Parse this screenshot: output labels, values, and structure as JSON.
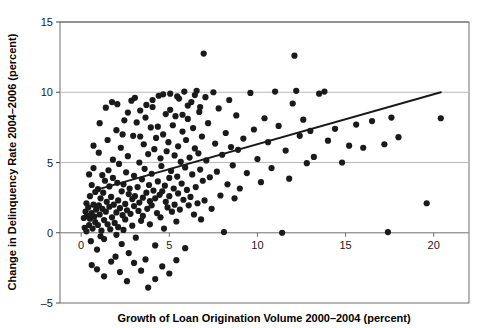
{
  "chart_data": {
    "type": "scatter",
    "title": "",
    "xlabel": "Growth of Loan Origination Volume 2000–2004 (percent)",
    "ylabel": "Change in Delinquency Rate 2004–2006 (percent)",
    "xlim": [
      -1.2,
      22.0
    ],
    "ylim": [
      -5,
      15
    ],
    "xticks": [
      0,
      5,
      10,
      15,
      20
    ],
    "xticklabels": [
      "0",
      "5",
      "10",
      "15",
      "20"
    ],
    "yticks": [
      -5,
      0,
      5,
      10,
      15
    ],
    "yticklabels": [
      "-5",
      "0",
      "5",
      "10",
      "15"
    ],
    "grid": "horizontal",
    "legend": "none",
    "marker_color": "#1a1a1a",
    "marker_size": 3.1,
    "trendline": {
      "label": "linear fit",
      "color": "#1a1a1a",
      "width": 2.0,
      "x_start": 0.85,
      "y_start": 3.05,
      "x_end": 20.4,
      "y_end": 10.0
    },
    "points": [
      [
        0.15,
        1.05
      ],
      [
        0.2,
        0.35
      ],
      [
        0.25,
        1.5
      ],
      [
        0.3,
        2.1
      ],
      [
        0.3,
        0.1
      ],
      [
        0.35,
        1.2
      ],
      [
        0.4,
        1.8
      ],
      [
        0.45,
        0.55
      ],
      [
        0.5,
        2.6
      ],
      [
        0.5,
        1.0
      ],
      [
        0.55,
        -0.6
      ],
      [
        0.6,
        3.4
      ],
      [
        0.6,
        1.4
      ],
      [
        0.65,
        0.3
      ],
      [
        0.7,
        2.0
      ],
      [
        0.7,
        4.6
      ],
      [
        0.75,
        1.15
      ],
      [
        0.8,
        0.75
      ],
      [
        0.8,
        2.9
      ],
      [
        0.85,
        1.65
      ],
      [
        0.9,
        -1.2
      ],
      [
        0.95,
        3.1
      ],
      [
        0.95,
        0.55
      ],
      [
        1.0,
        1.95
      ],
      [
        1.0,
        5.7
      ],
      [
        1.05,
        1.3
      ],
      [
        1.1,
        2.45
      ],
      [
        1.15,
        0.15
      ],
      [
        1.2,
        4.1
      ],
      [
        1.2,
        1.7
      ],
      [
        1.25,
        2.85
      ],
      [
        1.3,
        0.9
      ],
      [
        1.3,
        -0.45
      ],
      [
        1.35,
        3.7
      ],
      [
        1.4,
        1.5
      ],
      [
        1.45,
        2.2
      ],
      [
        1.5,
        6.6
      ],
      [
        1.5,
        0.6
      ],
      [
        1.55,
        4.45
      ],
      [
        1.6,
        1.85
      ],
      [
        1.6,
        3.3
      ],
      [
        1.65,
        0.25
      ],
      [
        1.7,
        2.55
      ],
      [
        1.75,
        1.1
      ],
      [
        1.8,
        5.2
      ],
      [
        1.8,
        3.9
      ],
      [
        1.85,
        2.0
      ],
      [
        1.9,
        0.7
      ],
      [
        1.95,
        -1.7
      ],
      [
        2.0,
        7.3
      ],
      [
        2.0,
        1.45
      ],
      [
        2.05,
        3.55
      ],
      [
        2.1,
        2.3
      ],
      [
        2.1,
        0.4
      ],
      [
        2.15,
        4.9
      ],
      [
        2.2,
        1.75
      ],
      [
        2.25,
        6.05
      ],
      [
        2.3,
        2.95
      ],
      [
        2.3,
        -0.8
      ],
      [
        2.35,
        1.25
      ],
      [
        2.4,
        3.45
      ],
      [
        2.45,
        8.0
      ],
      [
        2.5,
        2.05
      ],
      [
        2.5,
        0.95
      ],
      [
        2.55,
        4.3
      ],
      [
        2.6,
        1.6
      ],
      [
        2.65,
        5.45
      ],
      [
        2.7,
        2.75
      ],
      [
        2.7,
        -1.45
      ],
      [
        2.75,
        3.15
      ],
      [
        2.8,
        1.35
      ],
      [
        2.85,
        9.4
      ],
      [
        2.9,
        2.4
      ],
      [
        2.9,
        0.5
      ],
      [
        2.95,
        6.9
      ],
      [
        3.0,
        4.05
      ],
      [
        3.0,
        1.9
      ],
      [
        3.05,
        2.6
      ],
      [
        3.1,
        -0.35
      ],
      [
        3.15,
        7.85
      ],
      [
        3.2,
        3.25
      ],
      [
        3.25,
        1.55
      ],
      [
        3.3,
        5.0
      ],
      [
        3.3,
        2.15
      ],
      [
        3.35,
        8.7
      ],
      [
        3.4,
        0.85
      ],
      [
        3.45,
        3.8
      ],
      [
        3.5,
        2.5
      ],
      [
        3.5,
        1.2
      ],
      [
        3.55,
        6.3
      ],
      [
        3.6,
        4.55
      ],
      [
        3.65,
        -1.9
      ],
      [
        3.7,
        2.85
      ],
      [
        3.7,
        9.1
      ],
      [
        3.75,
        1.7
      ],
      [
        3.8,
        5.6
      ],
      [
        3.85,
        3.4
      ],
      [
        3.9,
        2.25
      ],
      [
        3.9,
        0.6
      ],
      [
        3.95,
        7.5
      ],
      [
        4.0,
        4.2
      ],
      [
        4.0,
        1.95
      ],
      [
        4.05,
        8.95
      ],
      [
        4.1,
        3.0
      ],
      [
        4.15,
        5.95
      ],
      [
        4.2,
        2.45
      ],
      [
        4.2,
        -0.9
      ],
      [
        4.25,
        6.75
      ],
      [
        4.3,
        1.4
      ],
      [
        4.35,
        3.65
      ],
      [
        4.4,
        9.75
      ],
      [
        4.45,
        2.7
      ],
      [
        4.5,
        5.3
      ],
      [
        4.5,
        1.1
      ],
      [
        4.55,
        4.75
      ],
      [
        4.6,
        2.95
      ],
      [
        4.65,
        7.0
      ],
      [
        4.7,
        0.3
      ],
      [
        4.75,
        3.35
      ],
      [
        4.8,
        8.45
      ],
      [
        4.8,
        2.2
      ],
      [
        4.85,
        5.8
      ],
      [
        4.9,
        1.8
      ],
      [
        4.95,
        6.45
      ],
      [
        5.0,
        3.9
      ],
      [
        5.0,
        2.6
      ],
      [
        5.05,
        9.9
      ],
      [
        5.1,
        4.4
      ],
      [
        5.15,
        1.5
      ],
      [
        5.2,
        7.65
      ],
      [
        5.25,
        3.15
      ],
      [
        5.3,
        5.5
      ],
      [
        5.3,
        2.0
      ],
      [
        5.35,
        8.3
      ],
      [
        5.4,
        0.8
      ],
      [
        5.45,
        4.0
      ],
      [
        5.5,
        6.15
      ],
      [
        5.5,
        2.8
      ],
      [
        5.55,
        9.55
      ],
      [
        5.6,
        1.65
      ],
      [
        5.65,
        5.05
      ],
      [
        5.7,
        3.5
      ],
      [
        5.75,
        7.2
      ],
      [
        5.8,
        2.35
      ],
      [
        5.85,
        10.05
      ],
      [
        5.9,
        4.65
      ],
      [
        5.9,
        -1.1
      ],
      [
        5.95,
        6.6
      ],
      [
        6.0,
        3.05
      ],
      [
        6.05,
        8.1
      ],
      [
        6.1,
        1.95
      ],
      [
        6.15,
        5.35
      ],
      [
        6.2,
        2.55
      ],
      [
        6.25,
        9.3
      ],
      [
        6.3,
        4.15
      ],
      [
        6.35,
        7.45
      ],
      [
        6.4,
        1.3
      ],
      [
        6.45,
        6.0
      ],
      [
        6.5,
        3.25
      ],
      [
        6.55,
        10.1
      ],
      [
        6.6,
        2.1
      ],
      [
        6.65,
        5.65
      ],
      [
        6.7,
        8.6
      ],
      [
        6.75,
        4.5
      ],
      [
        6.8,
        0.95
      ],
      [
        6.85,
        6.85
      ],
      [
        6.9,
        3.7
      ],
      [
        6.95,
        12.75
      ],
      [
        7.0,
        2.3
      ],
      [
        7.05,
        9.65
      ],
      [
        7.1,
        5.15
      ],
      [
        7.2,
        7.8
      ],
      [
        7.3,
        3.95
      ],
      [
        7.4,
        1.7
      ],
      [
        7.5,
        10.0
      ],
      [
        7.6,
        6.35
      ],
      [
        7.7,
        4.35
      ],
      [
        7.8,
        8.85
      ],
      [
        7.9,
        2.65
      ],
      [
        8.0,
        5.55
      ],
      [
        8.1,
        0.05
      ],
      [
        8.2,
        7.1
      ],
      [
        8.3,
        3.45
      ],
      [
        8.4,
        9.45
      ],
      [
        8.5,
        6.1
      ],
      [
        8.6,
        4.8
      ],
      [
        8.7,
        2.45
      ],
      [
        8.8,
        8.35
      ],
      [
        8.9,
        5.9
      ],
      [
        9.0,
        3.15
      ],
      [
        9.2,
        6.7
      ],
      [
        9.4,
        4.25
      ],
      [
        9.6,
        9.95
      ],
      [
        9.8,
        7.35
      ],
      [
        10.0,
        5.25
      ],
      [
        10.2,
        3.6
      ],
      [
        10.4,
        8.15
      ],
      [
        10.6,
        6.45
      ],
      [
        10.8,
        4.6
      ],
      [
        11.0,
        10.05
      ],
      [
        11.2,
        7.6
      ],
      [
        11.4,
        0.0
      ],
      [
        11.6,
        5.85
      ],
      [
        11.8,
        3.85
      ],
      [
        12.0,
        9.2
      ],
      [
        12.1,
        12.6
      ],
      [
        12.2,
        10.1
      ],
      [
        12.4,
        6.9
      ],
      [
        12.6,
        8.05
      ],
      [
        12.8,
        4.95
      ],
      [
        13.0,
        7.25
      ],
      [
        13.2,
        5.4
      ],
      [
        13.5,
        9.9
      ],
      [
        13.8,
        10.05
      ],
      [
        14.0,
        6.55
      ],
      [
        14.4,
        7.4
      ],
      [
        14.8,
        5.0
      ],
      [
        15.2,
        6.2
      ],
      [
        15.6,
        7.7
      ],
      [
        16.0,
        6.05
      ],
      [
        16.5,
        7.95
      ],
      [
        17.2,
        6.3
      ],
      [
        17.4,
        0.05
      ],
      [
        17.6,
        8.2
      ],
      [
        18.0,
        6.8
      ],
      [
        19.6,
        2.1
      ],
      [
        20.4,
        8.15
      ],
      [
        0.6,
        -2.3
      ],
      [
        0.9,
        -2.6
      ],
      [
        1.3,
        -3.1
      ],
      [
        1.7,
        -2.05
      ],
      [
        2.2,
        -2.8
      ],
      [
        2.6,
        -3.45
      ],
      [
        3.0,
        -2.15
      ],
      [
        3.4,
        -2.7
      ],
      [
        3.8,
        -3.9
      ],
      [
        4.2,
        -3.3
      ],
      [
        4.6,
        -2.4
      ],
      [
        5.0,
        -2.9
      ],
      [
        5.4,
        -1.95
      ],
      [
        2.0,
        -0.15
      ],
      [
        2.4,
        0.2
      ],
      [
        1.1,
        -0.25
      ],
      [
        0.45,
        4.15
      ],
      [
        0.7,
        6.2
      ],
      [
        1.05,
        7.8
      ],
      [
        1.4,
        8.9
      ],
      [
        1.75,
        9.3
      ],
      [
        2.05,
        9.15
      ],
      [
        2.35,
        7.0
      ],
      [
        2.65,
        8.55
      ],
      [
        3.05,
        9.6
      ],
      [
        3.35,
        6.85
      ],
      [
        3.65,
        8.2
      ],
      [
        4.05,
        9.45
      ],
      [
        4.35,
        7.55
      ],
      [
        4.65,
        9.85
      ],
      [
        5.05,
        8.75
      ],
      [
        5.45,
        9.7
      ],
      [
        5.75,
        8.4
      ],
      [
        6.05,
        9.05
      ],
      [
        6.45,
        9.8
      ],
      [
        6.75,
        8.95
      ]
    ]
  }
}
